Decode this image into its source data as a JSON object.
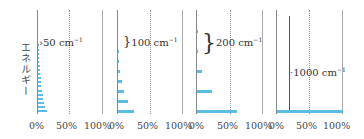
{
  "chart_data": {
    "type": "bar",
    "orientation": "horizontal",
    "ylabel": "エネルギー",
    "xlabel": "",
    "x_ticks": [
      "0%",
      "50%",
      "100%"
    ],
    "xlim": [
      0,
      100
    ],
    "grid": "dotted line at 50%",
    "panels": [
      {
        "spacing_label": "50 cm",
        "spacing_unit_exp": "−1",
        "level_spacing_cm-1": 50,
        "levels": 17,
        "values": [
          14,
          11,
          9.5,
          8,
          7,
          6,
          5,
          4.5,
          4,
          3.5,
          3,
          2.5,
          2,
          1.5,
          1.2,
          1,
          0.8
        ]
      },
      {
        "spacing_label": "100 cm",
        "spacing_unit_exp": "−1",
        "level_spacing_cm-1": 100,
        "levels": 7,
        "values": [
          25,
          15,
          9,
          6,
          3,
          1.5,
          1
        ]
      },
      {
        "spacing_label": "200 cm",
        "spacing_unit_exp": "−1",
        "level_spacing_cm-1": 200,
        "levels": 5,
        "values": [
          60,
          23,
          8,
          2,
          1
        ]
      },
      {
        "spacing_label": "1000 cm",
        "spacing_unit_exp": "−1",
        "level_spacing_cm-1": 1000,
        "levels": 1,
        "values": [
          100
        ]
      }
    ],
    "bar_color": "#5bbde6"
  },
  "labels": {
    "ylabel": "エネルギー",
    "p1": "50 cm",
    "p2": "100 cm",
    "p3": "200 cm",
    "p4": "1000 cm",
    "exp": "−1",
    "x0": "0%",
    "x50": "50%",
    "x100": "100%"
  }
}
